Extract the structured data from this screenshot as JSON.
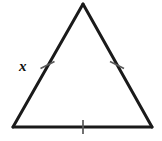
{
  "figure": {
    "kind": "geometry-diagram",
    "shape_name": "equilateral triangle",
    "background_color": "#ffffff",
    "stroke_color": "#1a1a1a",
    "tick_color": "#595959",
    "stroke_width": 3,
    "tick_width": 1.6,
    "canvas": {
      "width": 162,
      "height": 141
    },
    "vertices": {
      "apex": {
        "x": 83,
        "y": 4
      },
      "bottom_left": {
        "x": 13,
        "y": 127
      },
      "bottom_right": {
        "x": 152,
        "y": 127
      }
    },
    "sides": [
      {
        "name": "left-side",
        "from": "bottom_left",
        "to": "apex",
        "tick_count": 1,
        "tick_center": {
          "x": 47.5,
          "y": 65
        },
        "label": "x"
      },
      {
        "name": "right-side",
        "from": "apex",
        "to": "bottom_right",
        "tick_count": 1,
        "tick_center": {
          "x": 117,
          "y": 65
        },
        "label": ""
      },
      {
        "name": "base-side",
        "from": "bottom_left",
        "to": "bottom_right",
        "tick_count": 1,
        "tick_center": {
          "x": 83,
          "y": 127
        },
        "label": ""
      }
    ],
    "labels": {
      "left_side_label": "x"
    },
    "icons": {
      "tick_mark": "congruence-tick-icon"
    }
  }
}
